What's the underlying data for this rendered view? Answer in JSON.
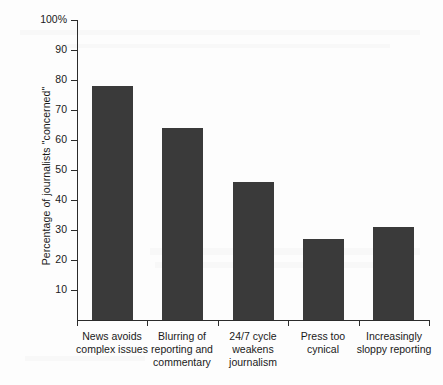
{
  "chart_data": {
    "type": "bar",
    "title": "",
    "xlabel": "",
    "ylabel": "Percentage of journalists \"concerned\"",
    "ylim": [
      0,
      100
    ],
    "yticks": [
      10,
      20,
      30,
      40,
      50,
      60,
      70,
      80,
      90,
      100
    ],
    "ytick_labels": [
      "10",
      "20",
      "30",
      "40",
      "50",
      "60",
      "70",
      "80",
      "90",
      "100%"
    ],
    "grid": false,
    "legend": null,
    "bar_color": "#3a3a3a",
    "categories": [
      "News avoids complex issues",
      "Blurring of reporting and commentary",
      "24/7 cycle weakens journalism",
      "Press too cynical",
      "Increasingly sloppy reporting"
    ],
    "category_lines": [
      [
        "News avoids",
        "complex issues"
      ],
      [
        "Blurring of",
        "reporting and",
        "commentary"
      ],
      [
        "24/7 cycle",
        "weakens",
        "journalism"
      ],
      [
        "Press too",
        "cynical"
      ],
      [
        "Increasingly",
        "sloppy reporting"
      ]
    ],
    "values": [
      78,
      64,
      46,
      27,
      31
    ]
  }
}
